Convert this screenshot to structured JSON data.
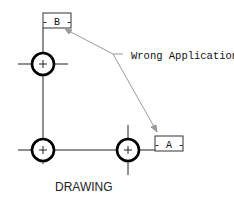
{
  "diagram": {
    "datum_b": {
      "label": "- B -"
    },
    "datum_a": {
      "label": "- A -"
    },
    "annotation": {
      "text": "Wrong Application"
    },
    "caption": {
      "text": "DRAWING"
    },
    "holes": [
      {
        "id": "hole-top",
        "cx": 43,
        "cy": 64
      },
      {
        "id": "hole-bottom-left",
        "cx": 43,
        "cy": 150
      },
      {
        "id": "hole-bottom-right",
        "cx": 128,
        "cy": 150
      }
    ],
    "colors": {
      "line": "#000000",
      "leader": "#9a9a9a",
      "background": "#ffffff"
    }
  }
}
